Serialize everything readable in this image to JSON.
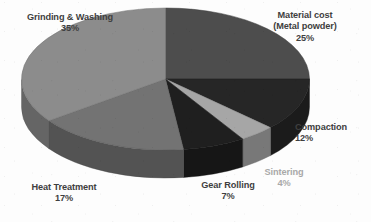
{
  "chart_data": {
    "type": "pie",
    "title": "",
    "subtitle": "",
    "xlabel": "",
    "ylabel": "",
    "legend_position": "none",
    "grid": false,
    "three_d": true,
    "start_angle_deg": 0,
    "direction": "clockwise",
    "units": "percent",
    "total": 100,
    "categories": [
      "Material cost (Metal powder)",
      "Compaction",
      "Sintering",
      "Gear Rolling",
      "Heat Treatment",
      "Grinding & Washing"
    ],
    "values": [
      25,
      12,
      4,
      7,
      17,
      35
    ],
    "slice_colors": [
      "#4d4d4d",
      "#262626",
      "#a6a6a6",
      "#1f1f1f",
      "#737373",
      "#8c8c8c"
    ],
    "slices": [
      {
        "name": "Material cost",
        "name_line2": "(Metal powder)",
        "value": 25,
        "value_label": "25%",
        "color": "#4d4d4d",
        "label_color": "#3f3f3f"
      },
      {
        "name": "Compaction",
        "name_line2": "",
        "value": 12,
        "value_label": "12%",
        "color": "#262626",
        "label_color": "#3f3f3f"
      },
      {
        "name": "Sintering",
        "name_line2": "",
        "value": 4,
        "value_label": "4%",
        "color": "#a6a6a6",
        "label_color": "#a9a9a9"
      },
      {
        "name": "Gear Rolling",
        "name_line2": "",
        "value": 7,
        "value_label": "7%",
        "color": "#1f1f1f",
        "label_color": "#3f3f3f"
      },
      {
        "name": "Heat Treatment",
        "name_line2": "",
        "value": 17,
        "value_label": "17%",
        "color": "#737373",
        "label_color": "#3f3f3f"
      },
      {
        "name": "Grinding & Washing",
        "name_line2": "",
        "value": 35,
        "value_label": "35%",
        "color": "#8c8c8c",
        "label_color": "#3f3f3f"
      }
    ]
  },
  "canvas": {
    "background": "#fdfdfd",
    "width": 371,
    "height": 222
  }
}
